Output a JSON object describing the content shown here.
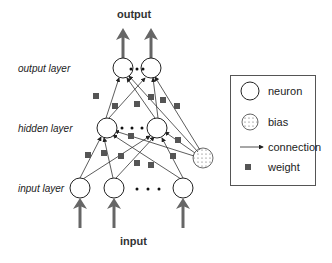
{
  "diagram": {
    "title_top": "output",
    "title_bottom": "input",
    "layers": [
      {
        "label": "output layer",
        "neurons": 2,
        "ellipsis": true
      },
      {
        "label": "hidden layer",
        "neurons": 2,
        "ellipsis": true
      },
      {
        "label": "input layer",
        "neurons": 3,
        "ellipsis": true
      }
    ],
    "bias_node": true
  },
  "legend": {
    "items": [
      {
        "symbol": "neuron-circle",
        "label": "neuron"
      },
      {
        "symbol": "bias-dotted-circle",
        "label": "bias"
      },
      {
        "symbol": "arrow",
        "label": "connection"
      },
      {
        "symbol": "square",
        "label": "weight"
      }
    ]
  },
  "colors": {
    "arrow": "#666666",
    "weight": "#555555",
    "line": "#333333"
  }
}
